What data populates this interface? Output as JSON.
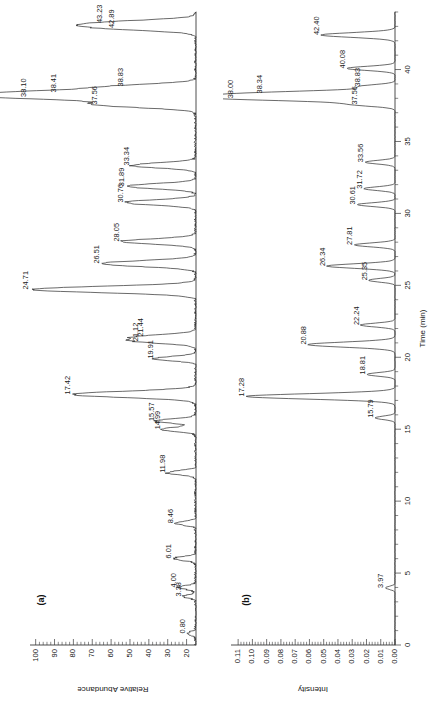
{
  "figure": {
    "panels": [
      {
        "tag": "(a)",
        "yaxis": {
          "title": "Relative Abundance",
          "ticks": [
            20,
            30,
            40,
            50,
            60,
            70,
            80,
            90,
            100
          ],
          "min": 15,
          "max": 103
        },
        "peaks": [
          {
            "label": "0.80",
            "time": 0.8,
            "height": 0.055
          },
          {
            "label": "3.38",
            "time": 3.38,
            "height": 0.075
          },
          {
            "label": "4.00",
            "time": 4.0,
            "height": 0.105
          },
          {
            "label": "6.01",
            "time": 6.01,
            "height": 0.135
          },
          {
            "label": "8.46",
            "time": 8.46,
            "height": 0.125
          },
          {
            "label": "11.98",
            "time": 11.98,
            "height": 0.175
          },
          {
            "label": "14.99",
            "time": 14.99,
            "height": 0.205
          },
          {
            "label": "15.57",
            "time": 15.57,
            "height": 0.235
          },
          {
            "label": "17.42",
            "time": 17.42,
            "height": 0.735
          },
          {
            "label": "19.91",
            "time": 19.91,
            "height": 0.245
          },
          {
            "label": "21.12",
            "time": 21.12,
            "height": 0.335
          },
          {
            "label": "21.44",
            "time": 21.44,
            "height": 0.305
          },
          {
            "label": "24.71",
            "time": 24.71,
            "height": 0.985
          },
          {
            "label": "26.51",
            "time": 26.51,
            "height": 0.565
          },
          {
            "label": "28.05",
            "time": 28.05,
            "height": 0.445
          },
          {
            "label": "30.76",
            "time": 30.76,
            "height": 0.425
          },
          {
            "label": "31.89",
            "time": 31.89,
            "height": 0.415
          },
          {
            "label": "33.34",
            "time": 33.34,
            "height": 0.385
          },
          {
            "label": "37.56",
            "time": 37.56,
            "height": 0.575
          },
          {
            "label": "38.10",
            "time": 38.1,
            "height": 1.0
          },
          {
            "label": "38.41",
            "time": 38.41,
            "height": 0.82
          },
          {
            "label": "38.83",
            "time": 38.83,
            "height": 0.425
          },
          {
            "label": "42.89",
            "time": 42.89,
            "height": 0.475
          },
          {
            "label": "43.23",
            "time": 43.23,
            "height": 0.545
          }
        ]
      },
      {
        "tag": "(b)",
        "yaxis": {
          "title": "Intensity",
          "ticks": [
            "0.00",
            "0.01",
            "0.02",
            "0.03",
            "0.04",
            "0.05",
            "0.06",
            "0.07",
            "0.08",
            "0.09",
            "0.10",
            "0.11"
          ],
          "min": 0.0,
          "max": 0.115
        },
        "xaxis": {
          "title": "Time (min)",
          "ticks": [
            0,
            5,
            10,
            15,
            20,
            25,
            30,
            35,
            40
          ],
          "min": 0,
          "max": 44
        },
        "peaks": [
          {
            "label": "3.97",
            "time": 3.97,
            "height": 0.06
          },
          {
            "label": "15.79",
            "time": 15.79,
            "height": 0.125
          },
          {
            "label": "17.28",
            "time": 17.28,
            "height": 0.93
          },
          {
            "label": "18.81",
            "time": 18.81,
            "height": 0.175
          },
          {
            "label": "20.88",
            "time": 20.88,
            "height": 0.545
          },
          {
            "label": "22.24",
            "time": 22.24,
            "height": 0.215
          },
          {
            "label": "25.35",
            "time": 25.35,
            "height": 0.165
          },
          {
            "label": "26.34",
            "time": 26.34,
            "height": 0.425
          },
          {
            "label": "27.81",
            "time": 27.81,
            "height": 0.255
          },
          {
            "label": "30.61",
            "time": 30.61,
            "height": 0.235
          },
          {
            "label": "31.72",
            "time": 31.72,
            "height": 0.195
          },
          {
            "label": "33.56",
            "time": 33.56,
            "height": 0.185
          },
          {
            "label": "37.56",
            "time": 37.56,
            "height": 0.225
          },
          {
            "label": "38.00",
            "time": 38.0,
            "height": 1.0
          },
          {
            "label": "38.34",
            "time": 38.34,
            "height": 0.82
          },
          {
            "label": "38.83",
            "time": 38.83,
            "height": 0.205
          },
          {
            "label": "40.08",
            "time": 40.08,
            "height": 0.3
          },
          {
            "label": "42.40",
            "time": 42.4,
            "height": 0.46
          }
        ]
      }
    ]
  },
  "chart_data": [
    {
      "type": "line",
      "title": "(a)",
      "xlabel": "Time (min)",
      "ylabel": "Relative Abundance",
      "xlim": [
        0,
        44
      ],
      "ylim": [
        15,
        103
      ],
      "yticks": [
        20,
        30,
        40,
        50,
        60,
        70,
        80,
        90,
        100
      ],
      "grid": false,
      "legend": "none",
      "orientation": "rotated-90",
      "annotations": [
        "0.80",
        "3.38",
        "4.00",
        "6.01",
        "8.46",
        "11.98",
        "14.99",
        "15.57",
        "17.42",
        "19.91",
        "21.12",
        "21.44",
        "24.71",
        "26.51",
        "28.05",
        "30.76",
        "31.89",
        "33.34",
        "37.56",
        "38.10",
        "38.41",
        "38.83",
        "42.89",
        "43.23"
      ],
      "x": [
        0.8,
        3.38,
        4.0,
        6.01,
        8.46,
        11.98,
        14.99,
        15.57,
        17.42,
        19.91,
        21.12,
        21.44,
        24.71,
        26.51,
        28.05,
        30.76,
        31.89,
        33.34,
        37.56,
        38.1,
        38.41,
        38.83,
        42.89,
        43.23
      ],
      "y": [
        23.8,
        25.5,
        27.9,
        30.3,
        29.4,
        33.5,
        36.1,
        38.6,
        82.2,
        39.5,
        47.4,
        44.8,
        104.0,
        64.9,
        54.4,
        52.6,
        51.7,
        49.1,
        65.8,
        110.0,
        92.3,
        52.6,
        56.9,
        62.9
      ]
    },
    {
      "type": "line",
      "title": "(b)",
      "xlabel": "Time (min)",
      "ylabel": "Intensity",
      "xlim": [
        0,
        44
      ],
      "ylim": [
        0.0,
        0.115
      ],
      "yticks": [
        0.0,
        0.01,
        0.02,
        0.03,
        0.04,
        0.05,
        0.06,
        0.07,
        0.08,
        0.09,
        0.1,
        0.11
      ],
      "xticks": [
        0,
        5,
        10,
        15,
        20,
        25,
        30,
        35,
        40
      ],
      "grid": false,
      "legend": "none",
      "orientation": "rotated-90",
      "annotations": [
        "3.97",
        "15.79",
        "17.28",
        "18.81",
        "20.88",
        "22.24",
        "25.35",
        "26.34",
        "27.81",
        "30.61",
        "31.72",
        "33.56",
        "37.56",
        "38.00",
        "38.34",
        "38.83",
        "40.08",
        "42.40"
      ],
      "x": [
        3.97,
        15.79,
        17.28,
        18.81,
        20.88,
        22.24,
        25.35,
        26.34,
        27.81,
        30.61,
        31.72,
        33.56,
        37.56,
        38.0,
        38.34,
        38.83,
        40.08,
        42.4
      ],
      "y": [
        0.0069,
        0.0144,
        0.107,
        0.0201,
        0.0627,
        0.0247,
        0.019,
        0.0489,
        0.0293,
        0.027,
        0.0224,
        0.0213,
        0.0259,
        0.115,
        0.0943,
        0.0236,
        0.0345,
        0.0529
      ]
    }
  ]
}
